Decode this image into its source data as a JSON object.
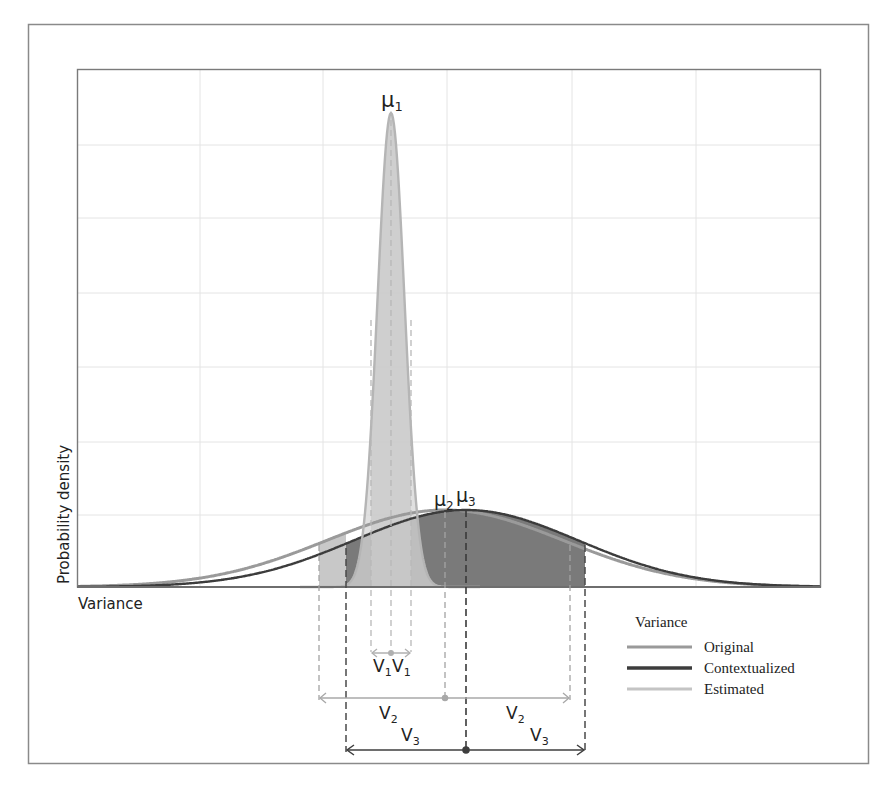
{
  "figure": {
    "y_axis_label": "Probability density",
    "x_axis_label": "Variance",
    "mean_labels": {
      "mu1": {
        "base": "μ",
        "sub": "1"
      },
      "mu2": {
        "base": "μ",
        "sub": "2"
      },
      "mu3": {
        "base": "μ",
        "sub": "3"
      }
    },
    "interval_labels": {
      "v1_left": {
        "base": "V",
        "sub": "1"
      },
      "v1_right": {
        "base": "V",
        "sub": "1"
      },
      "v2_left": {
        "base": "V",
        "sub": "2"
      },
      "v2_right": {
        "base": "V",
        "sub": "2"
      },
      "v3_left": {
        "base": "V",
        "sub": "3"
      },
      "v3_right": {
        "base": "V",
        "sub": "3"
      }
    },
    "legend": {
      "title": "Variance",
      "items": [
        {
          "label": "Original",
          "color": "#9a9a9a"
        },
        {
          "label": "Contextualized",
          "color": "#3c3c3c"
        },
        {
          "label": "Estimated",
          "color": "#c4c4c4"
        }
      ]
    },
    "colors": {
      "frame": "#8a8a8a",
      "grid": "#e4e4e4",
      "axis": "#6e6e6e",
      "narrow_fill": "#d6d6d6",
      "narrow_band_fill": "#cacaca",
      "wide_fill": "#7a7a7a",
      "wide_band_fill": "#6a6a6a",
      "estimated_tail_fill": "#c8c8c8",
      "original_line": "#9a9a9a",
      "contextualized_line": "#3c3c3c",
      "estimated_line": "#b5b5b5"
    }
  },
  "chart_data": {
    "type": "line",
    "title": "",
    "xlabel": "Variance",
    "ylabel": "Probability density",
    "grid": true,
    "ticks_shown": false,
    "legend_position": "lower right, outside plot",
    "series": [
      {
        "name": "Estimated",
        "mean_label": "μ1",
        "mean_rel_x": 0.421,
        "peak_rel_height": 0.91,
        "half_width_label": "V1",
        "shape": "narrow gaussian"
      },
      {
        "name": "Original",
        "mean_label": "μ2",
        "mean_rel_x": 0.494,
        "peak_rel_height": 0.16,
        "half_width_label": "V2",
        "shape": "wide gaussian"
      },
      {
        "name": "Contextualized",
        "mean_label": "μ3",
        "mean_rel_x": 0.522,
        "peak_rel_height": 0.15,
        "half_width_label": "V3",
        "shape": "wide gaussian"
      }
    ],
    "annotations": [
      "μ1",
      "μ2",
      "μ3",
      "V1 V1",
      "V2 V2",
      "V3 V3"
    ]
  }
}
